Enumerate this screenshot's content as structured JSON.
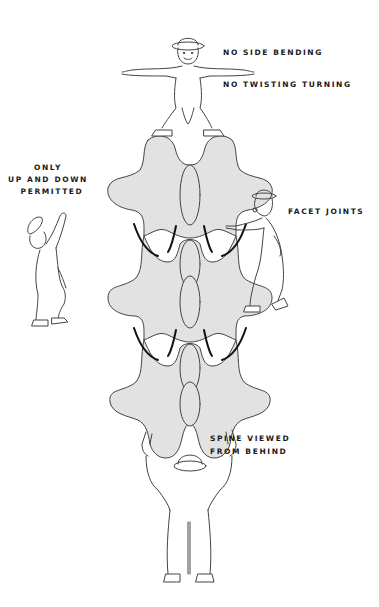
{
  "figure": {
    "colors": {
      "background": "#ffffff",
      "vertebra_fill": "#e2e2e2",
      "outline": "#444444",
      "facet_highlight": "#111111",
      "text": "#1a1a1a"
    },
    "labels": {
      "top_line1": "NO SIDE BENDING",
      "top_line2": "NO TWISTING TURNING",
      "left_line1": "ONLY",
      "left_line2": "UP AND DOWN",
      "left_line3": "PERMITTED",
      "right": "FACET JOINTS",
      "bottom_line1": "SPINE VIEWED",
      "bottom_line2": "FROM BEHIND"
    },
    "elements": {
      "vertebrae_count": 3,
      "figures": [
        "top-figure-arms-outstretched",
        "left-figure-pointing-up",
        "right-figure-pointing-at-facet",
        "bottom-figure-arms-raised"
      ]
    }
  }
}
